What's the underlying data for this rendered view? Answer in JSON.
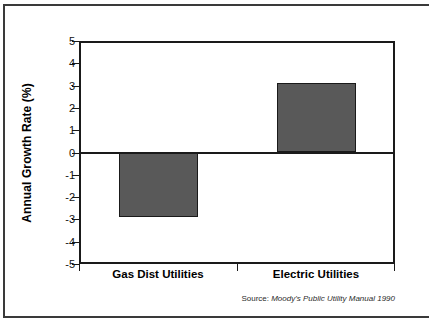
{
  "chart_data": {
    "type": "bar",
    "title": "",
    "subtitle": "",
    "xlabel": "",
    "ylabel": "Annual Growth Rate (%)",
    "categories": [
      "Gas Dist Utilities",
      "Electric Utilities"
    ],
    "values": [
      -2.9,
      3.1
    ],
    "ylim": [
      -5,
      5
    ],
    "yticks": [
      "5",
      "4",
      "3",
      "2",
      "1",
      "0",
      "-1",
      "-2",
      "-3",
      "-4",
      "-5"
    ],
    "ytick_values": [
      5,
      4,
      3,
      2,
      1,
      0,
      -1,
      -2,
      -3,
      -4,
      -5
    ],
    "grid": false,
    "legend": false,
    "legend_position": "none",
    "bar_color": "#595959",
    "bar_edge_color": "#1a1a1a",
    "axis_color": "#1a1a1a",
    "background": "#ffffff",
    "zero_line": true,
    "series": [
      {
        "name": "Annual Growth Rate",
        "values": [
          -2.9,
          3.1
        ]
      }
    ]
  },
  "notes": {
    "source_prefix": "Source: ",
    "source_title": "Moody's Public Utility Manual 1990"
  }
}
